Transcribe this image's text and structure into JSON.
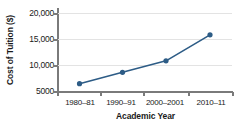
{
  "chart_data": {
    "type": "line",
    "title": "",
    "xlabel": "Academic Year",
    "ylabel": "Cost of Tuition ($)",
    "categories": [
      "1980–81",
      "1990–91",
      "2000–2001",
      "2010–11"
    ],
    "values": [
      6400,
      8600,
      10800,
      15800
    ],
    "ytick_labels": [
      "20,000",
      "15,000",
      "10,000",
      "5000"
    ],
    "ytick_values": [
      20000,
      15000,
      10000,
      5000
    ],
    "ylim": [
      5000,
      20000
    ],
    "grid": "horizontal",
    "legend": "none",
    "series_color": "#2d5c86",
    "marker": "circle",
    "gridline_color": "#e3e3e3",
    "axis_color": "#7a7a7a"
  }
}
